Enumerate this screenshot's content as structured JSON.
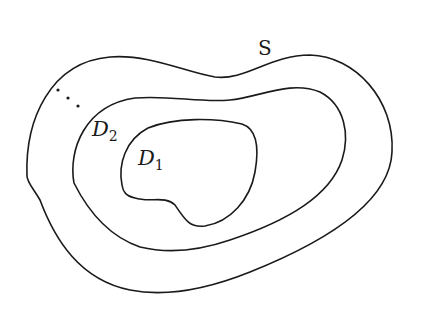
{
  "diagram": {
    "labels": {
      "outer": "S",
      "middle_main": "D",
      "middle_sub": "2",
      "inner_main": "D",
      "inner_sub": "1",
      "ellipsis": "..."
    },
    "regions": [
      {
        "name": "S",
        "level": "outer"
      },
      {
        "name": "D2",
        "level": "middle"
      },
      {
        "name": "D1",
        "level": "inner"
      }
    ],
    "colors": {
      "stroke": "#1a1a1a",
      "background": "#ffffff"
    }
  }
}
